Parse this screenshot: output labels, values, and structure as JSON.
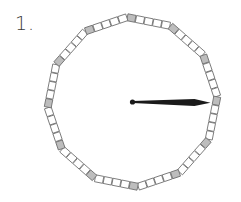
{
  "problem": {
    "number_label": "1."
  },
  "clock": {
    "center": [
      132.5,
      102
    ],
    "radius": 85,
    "sides": 12,
    "boxes_per_side": 5,
    "rotation_deg": -93.7,
    "box_thickness": 7,
    "colors": {
      "box_fill": "#ffffff",
      "vertex_box_fill": "#bdbdbd",
      "box_stroke": "#6a6a6a",
      "hand": "#1a1a1a"
    },
    "hand": {
      "pointing_to": "3 o'clock",
      "angle_deg": 0.5,
      "length": 78,
      "max_width": 7,
      "widest_at": 62,
      "pivot_radius": 2.6
    }
  }
}
